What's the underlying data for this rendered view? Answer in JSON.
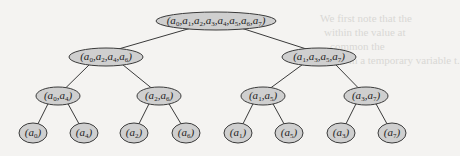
{
  "diagram": {
    "type": "binary-tree",
    "colors": {
      "node_fill": "#cfcfcf",
      "node_stroke": "#3a3a3a",
      "edge": "#3a3a3a"
    },
    "nodes": [
      {
        "id": "root",
        "label": "(a0,a1,a2,a3,a4,a5,a6,a7)",
        "indices": [
          0,
          1,
          2,
          3,
          4,
          5,
          6,
          7
        ],
        "x": 216,
        "y": 21,
        "rx": 60,
        "ry": 9
      },
      {
        "id": "n02",
        "label": "(a0,a2,a4,a6)",
        "indices": [
          0,
          2,
          4,
          6
        ],
        "x": 106,
        "y": 57,
        "rx": 37,
        "ry": 9
      },
      {
        "id": "n13",
        "label": "(a1,a3,a5,a7)",
        "indices": [
          1,
          3,
          5,
          7
        ],
        "x": 319,
        "y": 57,
        "rx": 37,
        "ry": 9
      },
      {
        "id": "n04",
        "label": "(a0,a4)",
        "indices": [
          0,
          4
        ],
        "x": 58,
        "y": 96,
        "rx": 22,
        "ry": 9
      },
      {
        "id": "n26",
        "label": "(a2,a6)",
        "indices": [
          2,
          6
        ],
        "x": 159,
        "y": 96,
        "rx": 22,
        "ry": 9
      },
      {
        "id": "n15",
        "label": "(a1,a5)",
        "indices": [
          1,
          5
        ],
        "x": 263,
        "y": 96,
        "rx": 22,
        "ry": 9
      },
      {
        "id": "n37",
        "label": "(a3,a7)",
        "indices": [
          3,
          7
        ],
        "x": 366,
        "y": 96,
        "rx": 22,
        "ry": 9
      },
      {
        "id": "l0",
        "label": "(a0)",
        "indices": [
          0
        ],
        "x": 33,
        "y": 133,
        "rx": 14,
        "ry": 10
      },
      {
        "id": "l4",
        "label": "(a4)",
        "indices": [
          4
        ],
        "x": 84,
        "y": 133,
        "rx": 14,
        "ry": 10
      },
      {
        "id": "l2",
        "label": "(a2)",
        "indices": [
          2
        ],
        "x": 134,
        "y": 133,
        "rx": 14,
        "ry": 10
      },
      {
        "id": "l6",
        "label": "(a6)",
        "indices": [
          6
        ],
        "x": 186,
        "y": 133,
        "rx": 14,
        "ry": 10
      },
      {
        "id": "l1",
        "label": "(a1)",
        "indices": [
          1
        ],
        "x": 238,
        "y": 133,
        "rx": 14,
        "ry": 10
      },
      {
        "id": "l5",
        "label": "(a5)",
        "indices": [
          5
        ],
        "x": 289,
        "y": 133,
        "rx": 14,
        "ry": 10
      },
      {
        "id": "l3",
        "label": "(a3)",
        "indices": [
          3
        ],
        "x": 341,
        "y": 133,
        "rx": 14,
        "ry": 10
      },
      {
        "id": "l7",
        "label": "(a7)",
        "indices": [
          7
        ],
        "x": 392,
        "y": 133,
        "rx": 14,
        "ry": 10
      }
    ],
    "edges": [
      [
        "root",
        "n02"
      ],
      [
        "root",
        "n13"
      ],
      [
        "n02",
        "n04"
      ],
      [
        "n02",
        "n26"
      ],
      [
        "n13",
        "n15"
      ],
      [
        "n13",
        "n37"
      ],
      [
        "n04",
        "l0"
      ],
      [
        "n04",
        "l4"
      ],
      [
        "n26",
        "l2"
      ],
      [
        "n26",
        "l6"
      ],
      [
        "n15",
        "l1"
      ],
      [
        "n15",
        "l5"
      ],
      [
        "n37",
        "l3"
      ],
      [
        "n37",
        "l7"
      ]
    ]
  },
  "background_bleed": [
    "We first note that the",
    "within the value at",
    "common the",
    "it in a temporary variable t."
  ]
}
